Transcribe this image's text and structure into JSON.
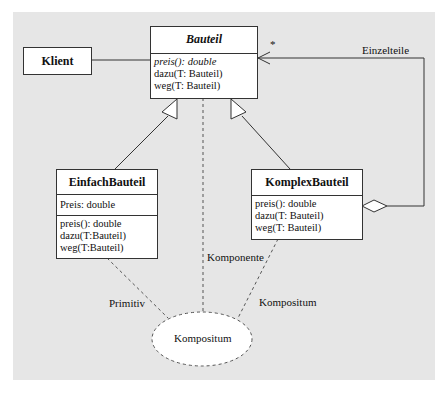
{
  "diagram": {
    "type": "uml-class-diagram",
    "classes": {
      "klient": {
        "name": "Klient"
      },
      "bauteil": {
        "name": "Bauteil",
        "abstract": true,
        "operations": [
          "preis(): double",
          "dazu(T: Bauteil)",
          "weg(T: Bauteil)"
        ]
      },
      "einfach": {
        "name": "EinfachBauteil",
        "attributes": [
          "Preis: double"
        ],
        "operations": [
          "preis(): double",
          "dazu(T:Bauteil)",
          "weg(T:Bauteil)"
        ]
      },
      "komplex": {
        "name": "KomplexBauteil",
        "operations": [
          "preis(): double",
          "dazu(T: Bauteil)",
          "weg(T: Bauteil)"
        ]
      }
    },
    "labels": {
      "einzelteile": "Einzelteile",
      "multiplicity": "*",
      "komponente": "Komponente",
      "primitiv": "Primitiv",
      "kompositum_role": "Kompositum",
      "collaboration": "Kompositum"
    },
    "colors": {
      "background": "#e6e6e6",
      "box_fill": "#ffffff",
      "line": "#333333"
    }
  }
}
